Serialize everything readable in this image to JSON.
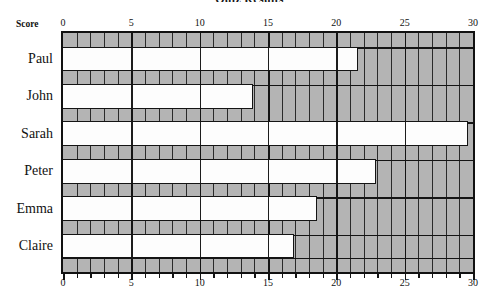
{
  "chart_data": {
    "type": "bar",
    "orientation": "horizontal",
    "title": "Quiz Results",
    "xlabel": "Score",
    "ylabel": "",
    "categories": [
      "Paul",
      "John",
      "Sarah",
      "Peter",
      "Emma",
      "Claire"
    ],
    "values": [
      21.5,
      13.8,
      29.5,
      22.8,
      18.5,
      16.8
    ],
    "xlim": [
      0,
      30
    ],
    "xticks": [
      0,
      5,
      10,
      15,
      20,
      25,
      30
    ],
    "xticklabels": [
      "0",
      "5",
      "10",
      "15",
      "20",
      "25",
      "30"
    ],
    "minor_tick_step": 1,
    "grid": true,
    "legend": false,
    "bar_fill": "#fdfdfd",
    "plot_background": "#b4b4b4",
    "line_color": "#141414",
    "axis_top": true,
    "axis_bottom": true
  },
  "axis": {
    "score_caption": "Score",
    "top_ticks": [
      "0",
      "5",
      "10",
      "15",
      "20",
      "25",
      "30"
    ],
    "bottom_ticks": [
      "0",
      "5",
      "10",
      "15",
      "20",
      "25",
      "30"
    ]
  },
  "labels": {
    "paul": "Paul",
    "john": "John",
    "sarah": "Sarah",
    "peter": "Peter",
    "emma": "Emma",
    "claire": "Claire"
  }
}
